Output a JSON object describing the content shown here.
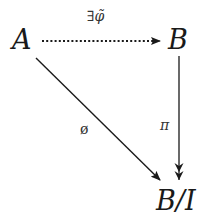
{
  "diagram": {
    "type": "commutative-diagram",
    "nodes": {
      "A": {
        "label": "A"
      },
      "B": {
        "label": "B"
      },
      "BI": {
        "label": "B/I"
      }
    },
    "edges": [
      {
        "from": "A",
        "to": "B",
        "label": "∃φ̃",
        "style": "dotted"
      },
      {
        "from": "B",
        "to": "B/I",
        "label": "π",
        "style": "two-headed (surjection)"
      },
      {
        "from": "A",
        "to": "B/I",
        "label": "ϕ",
        "style": "solid"
      }
    ],
    "labels": {
      "exists_phi_tilde": "∃φ̃",
      "pi": "π",
      "phi": "ø"
    }
  },
  "colors": {
    "ink": "#1a1a1a",
    "background": "#ffffff"
  }
}
